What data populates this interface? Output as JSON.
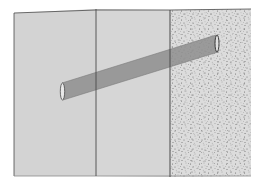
{
  "diagram": {
    "colors": {
      "background": "#ffffff",
      "panel_fill": "#d3d3d3",
      "stipple_fill": "#dcdcdc",
      "stipple_dot": "#6a6a6a",
      "edge_line": "#4a4a4a",
      "tube_fill": "#8e8e8e",
      "tube_end_fill": "#e8e8e8"
    },
    "regions": [
      {
        "id": "panel-left",
        "material": "plain"
      },
      {
        "id": "panel-middle",
        "material": "plain"
      },
      {
        "id": "layer-right",
        "material": "stippled"
      }
    ],
    "tube": {
      "start": {
        "x": 62,
        "y": 91
      },
      "end": {
        "x": 217,
        "y": 43
      },
      "diameter": 16
    }
  }
}
